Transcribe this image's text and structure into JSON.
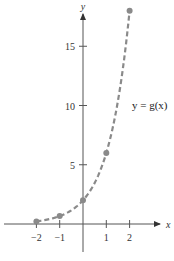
{
  "chart_data": {
    "type": "line",
    "title": "",
    "xlabel": "x",
    "ylabel": "y",
    "series": [
      {
        "name": "y = g(x)",
        "style": "dashed",
        "color": "#8a8a8a",
        "x": [
          -2,
          -1,
          0,
          1,
          2
        ],
        "y": [
          0.22,
          0.67,
          2,
          6,
          18
        ]
      }
    ],
    "x_ticks": [
      -2,
      -1,
      1,
      2
    ],
    "x_tick_labels": [
      "−2",
      "−1",
      "1",
      "2"
    ],
    "y_ticks": [
      5,
      10,
      15
    ],
    "y_tick_labels": [
      "5",
      "10",
      "15"
    ],
    "xlim": [
      -3.5,
      3.2
    ],
    "ylim": [
      -2.5,
      19
    ],
    "grid": false,
    "legend": "inline",
    "annotation": "y = g(x)"
  },
  "labels": {
    "x_axis": "x",
    "y_axis": "y",
    "curve": "y = g(x)"
  },
  "colors": {
    "axis": "#555555",
    "curve": "#8a8a8a",
    "point": "#8a8a8a"
  }
}
